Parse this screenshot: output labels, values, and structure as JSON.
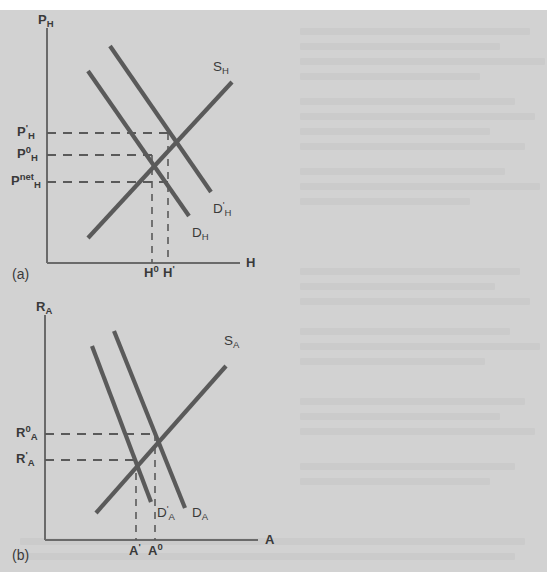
{
  "page": {
    "background_color": "#d2d2d2",
    "paper_color": "#ffffff",
    "ink_color": "#5a5a5a",
    "axis_color": "#6a6a6a"
  },
  "chart_data": {
    "type": "line",
    "title": "",
    "figure_kind": "two-panel supply-and-demand diagram",
    "panels": [
      {
        "id": "a",
        "panel_label": "(a)",
        "ylabel": "P",
        "ylabel_sub": "H",
        "xlabel": "H",
        "xlabel_sub": "",
        "axis_ranges": {
          "x": [
            0,
            1
          ],
          "y": [
            0,
            1
          ]
        },
        "grid": false,
        "legend": "inline curve labels",
        "series": [
          {
            "name": "S",
            "name_sub": "H",
            "name_sup": "",
            "role": "supply",
            "slope": "upward",
            "label_x": 216,
            "label_y": 68,
            "points": [
              [
                88,
                238
              ],
              [
                232,
                82
              ]
            ]
          },
          {
            "name": "D",
            "name_sub": "H",
            "name_sup": "",
            "role": "demand-initial",
            "slope": "downward",
            "label_x": 192,
            "label_y": 234,
            "points": [
              [
                88,
                71
              ],
              [
                189,
                216
              ]
            ]
          },
          {
            "name": "D",
            "name_sub": "H",
            "name_sup": "'",
            "role": "demand-shifted-right",
            "slope": "downward",
            "label_x": 214,
            "label_y": 211,
            "points": [
              [
                110,
                46
              ],
              [
                211,
                192
              ]
            ]
          }
        ],
        "y_ticks": [
          {
            "label": "P",
            "sub": "H",
            "sup": "'",
            "y": 133,
            "text_y": 136
          },
          {
            "label": "P",
            "sub": "H",
            "sup": "0",
            "y": 155,
            "text_y": 158
          },
          {
            "label": "P",
            "sub": "H",
            "sup": "net",
            "y": 182,
            "text_y": 185
          }
        ],
        "x_ticks": [
          {
            "label": "H",
            "sup": "0",
            "x": 152,
            "text_x": 145
          },
          {
            "label": "H",
            "sup": "'",
            "x": 168,
            "text_x": 163
          }
        ],
        "equilibria": [
          {
            "name": "initial",
            "x": 152,
            "y": 155
          },
          {
            "name": "shifted",
            "x": 168,
            "y": 133
          }
        ]
      },
      {
        "id": "b",
        "panel_label": "(b)",
        "ylabel": "R",
        "ylabel_sub": "A",
        "xlabel": "A",
        "xlabel_sub": "",
        "axis_ranges": {
          "x": [
            0,
            1
          ],
          "y": [
            0,
            1
          ]
        },
        "grid": false,
        "legend": "inline curve labels",
        "series": [
          {
            "name": "S",
            "name_sub": "A",
            "name_sup": "",
            "role": "supply",
            "slope": "upward",
            "label_x": 226,
            "label_y": 340,
            "points": [
              [
                96,
                513
              ],
              [
                226,
                366
              ]
            ]
          },
          {
            "name": "D",
            "name_sub": "A",
            "name_sup": "",
            "role": "demand-initial",
            "slope": "downward",
            "label_x": 196,
            "label_y": 513,
            "points": [
              [
                114,
                331
              ],
              [
                185,
                508
              ]
            ]
          },
          {
            "name": "D",
            "name_sub": "A",
            "name_sup": "'",
            "role": "demand-shifted-left",
            "slope": "downward",
            "label_x": 159,
            "label_y": 513,
            "points": [
              [
                92,
                346
              ],
              [
                151,
                502
              ]
            ]
          }
        ],
        "y_ticks": [
          {
            "label": "R",
            "sub": "A",
            "sup": "0",
            "y": 434,
            "text_y": 437
          },
          {
            "label": "R",
            "sub": "A",
            "sup": "'",
            "y": 460,
            "text_y": 463
          }
        ],
        "x_ticks": [
          {
            "label": "A",
            "sup": "'",
            "x": 136,
            "text_x": 131
          },
          {
            "label": "A",
            "sup": "0",
            "x": 155,
            "text_x": 150
          }
        ],
        "equilibria": [
          {
            "name": "initial",
            "x": 155,
            "y": 434
          },
          {
            "name": "shifted",
            "x": 136,
            "y": 460
          }
        ]
      }
    ]
  },
  "labels": {
    "panel_a": "(a)",
    "panel_b": "(b)",
    "p_h": "P",
    "h": "H",
    "r_a": "R",
    "a": "A",
    "s_h": "S",
    "d_h": "D",
    "s_a": "S",
    "d_a": "D",
    "sub_h": "H",
    "sub_a": "A",
    "prime": "'",
    "zero": "0",
    "net": "net"
  }
}
